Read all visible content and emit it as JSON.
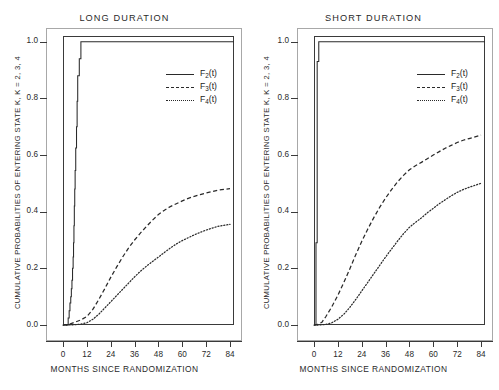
{
  "figure": {
    "xlabel": "MONTHS SINCE RANDOMIZATION",
    "ylabel": "CUMULATIVE PROBABILITIES OF ENTERING STATE K, K = 2, 3, 4",
    "xticks": [
      "0",
      "12",
      "24",
      "36",
      "48",
      "60",
      "72",
      "84"
    ],
    "yticks": [
      "0.0",
      "0.2",
      "0.4",
      "0.6",
      "0.8",
      "1.0"
    ],
    "legend": [
      {
        "key": "solid",
        "base": "F",
        "sub": "2",
        "suffix": "(t)",
        "label": "F2(t)"
      },
      {
        "key": "dashed",
        "base": "F",
        "sub": "3",
        "suffix": "(t)",
        "label": "F3(t)"
      },
      {
        "key": "dotted",
        "base": "F",
        "sub": "4",
        "suffix": "(t)",
        "label": "F4(t)"
      }
    ],
    "panels": [
      {
        "id": "long",
        "title": "LONG DURATION"
      },
      {
        "id": "short",
        "title": "SHORT DURATION"
      }
    ],
    "colors": {
      "line": "#2a2a2a",
      "frame": "#3a3a3a",
      "outer_frame": "#a8a8a8",
      "background": "#ffffff"
    }
  },
  "chart_data": [
    {
      "type": "line",
      "title": "LONG DURATION",
      "xlabel": "MONTHS SINCE RANDOMIZATION",
      "ylabel": "CUMULATIVE PROBABILITIES OF ENTERING STATE K, K = 2, 3, 4",
      "xlim": [
        0,
        86
      ],
      "ylim": [
        0.0,
        1.02
      ],
      "xticks": [
        0,
        12,
        24,
        36,
        48,
        60,
        72,
        84
      ],
      "yticks": [
        0.0,
        0.2,
        0.4,
        0.6,
        0.8,
        1.0
      ],
      "grid": false,
      "legend_position": "upper-right",
      "series": [
        {
          "name": "F2(t)",
          "style": "solid",
          "step": true,
          "points": [
            [
              0.0,
              0.0
            ],
            [
              2.6,
              0.0
            ],
            [
              2.6,
              0.025
            ],
            [
              3.1,
              0.025
            ],
            [
              3.1,
              0.05
            ],
            [
              3.5,
              0.05
            ],
            [
              3.5,
              0.078
            ],
            [
              3.9,
              0.078
            ],
            [
              3.9,
              0.1
            ],
            [
              4.2,
              0.1
            ],
            [
              4.2,
              0.128
            ],
            [
              4.5,
              0.128
            ],
            [
              4.5,
              0.158
            ],
            [
              4.8,
              0.158
            ],
            [
              4.8,
              0.2
            ],
            [
              5.1,
              0.2
            ],
            [
              5.1,
              0.24
            ],
            [
              5.3,
              0.24
            ],
            [
              5.3,
              0.29
            ],
            [
              5.5,
              0.29
            ],
            [
              5.5,
              0.35
            ],
            [
              5.7,
              0.35
            ],
            [
              5.7,
              0.42
            ],
            [
              5.9,
              0.42
            ],
            [
              5.9,
              0.48
            ],
            [
              6.1,
              0.48
            ],
            [
              6.1,
              0.545
            ],
            [
              6.4,
              0.545
            ],
            [
              6.4,
              0.625
            ],
            [
              6.8,
              0.625
            ],
            [
              6.8,
              0.7
            ],
            [
              7.1,
              0.7
            ],
            [
              7.1,
              0.79
            ],
            [
              7.4,
              0.79
            ],
            [
              7.4,
              0.88
            ],
            [
              8.2,
              0.88
            ],
            [
              8.2,
              0.94
            ],
            [
              9.0,
              0.94
            ],
            [
              9.0,
              1.0
            ],
            [
              86.0,
              1.0
            ]
          ]
        },
        {
          "name": "F3(t)",
          "style": "dashed",
          "step": false,
          "points": [
            [
              0,
              0.0
            ],
            [
              3,
              0.002
            ],
            [
              6,
              0.01
            ],
            [
              9,
              0.018
            ],
            [
              12,
              0.03
            ],
            [
              15,
              0.055
            ],
            [
              18,
              0.09
            ],
            [
              21,
              0.128
            ],
            [
              24,
              0.168
            ],
            [
              27,
              0.205
            ],
            [
              30,
              0.24
            ],
            [
              33,
              0.272
            ],
            [
              36,
              0.3
            ],
            [
              39,
              0.325
            ],
            [
              42,
              0.348
            ],
            [
              45,
              0.37
            ],
            [
              48,
              0.39
            ],
            [
              51,
              0.405
            ],
            [
              54,
              0.418
            ],
            [
              57,
              0.428
            ],
            [
              60,
              0.438
            ],
            [
              63,
              0.447
            ],
            [
              66,
              0.454
            ],
            [
              69,
              0.46
            ],
            [
              72,
              0.466
            ],
            [
              75,
              0.471
            ],
            [
              78,
              0.476
            ],
            [
              81,
              0.479
            ],
            [
              84,
              0.481
            ]
          ],
          "final_value": 0.48
        },
        {
          "name": "F4(t)",
          "style": "dotted",
          "step": false,
          "points": [
            [
              0,
              0.0
            ],
            [
              3,
              0.0
            ],
            [
              6,
              0.001
            ],
            [
              9,
              0.003
            ],
            [
              12,
              0.008
            ],
            [
              15,
              0.02
            ],
            [
              18,
              0.038
            ],
            [
              21,
              0.06
            ],
            [
              24,
              0.082
            ],
            [
              27,
              0.104
            ],
            [
              30,
              0.126
            ],
            [
              33,
              0.148
            ],
            [
              36,
              0.17
            ],
            [
              39,
              0.19
            ],
            [
              42,
              0.208
            ],
            [
              45,
              0.224
            ],
            [
              48,
              0.24
            ],
            [
              51,
              0.256
            ],
            [
              54,
              0.272
            ],
            [
              57,
              0.286
            ],
            [
              60,
              0.298
            ],
            [
              63,
              0.308
            ],
            [
              66,
              0.318
            ],
            [
              69,
              0.327
            ],
            [
              72,
              0.335
            ],
            [
              75,
              0.342
            ],
            [
              78,
              0.348
            ],
            [
              81,
              0.352
            ],
            [
              84,
              0.355
            ]
          ],
          "final_value": 0.355
        }
      ]
    },
    {
      "type": "line",
      "title": "SHORT DURATION",
      "xlabel": "MONTHS SINCE RANDOMIZATION",
      "ylabel": "CUMULATIVE PROBABILITIES OF ENTERING STATE K, K = 2, 3, 4",
      "xlim": [
        0,
        86
      ],
      "ylim": [
        0.0,
        1.02
      ],
      "xticks": [
        0,
        12,
        24,
        36,
        48,
        60,
        72,
        84
      ],
      "yticks": [
        0.0,
        0.2,
        0.4,
        0.6,
        0.8,
        1.0
      ],
      "grid": false,
      "legend_position": "upper-right",
      "series": [
        {
          "name": "F2(t)",
          "style": "solid",
          "step": true,
          "points": [
            [
              0.0,
              0.0
            ],
            [
              1.0,
              0.0
            ],
            [
              1.0,
              0.29
            ],
            [
              1.6,
              0.29
            ],
            [
              1.6,
              0.93
            ],
            [
              2.4,
              0.93
            ],
            [
              2.4,
              1.0
            ],
            [
              86.0,
              1.0
            ]
          ]
        },
        {
          "name": "F3(t)",
          "style": "dashed",
          "step": false,
          "points": [
            [
              0,
              0.0
            ],
            [
              2,
              0.002
            ],
            [
              4,
              0.01
            ],
            [
              6,
              0.03
            ],
            [
              9,
              0.065
            ],
            [
              12,
              0.105
            ],
            [
              15,
              0.15
            ],
            [
              18,
              0.198
            ],
            [
              21,
              0.248
            ],
            [
              24,
              0.295
            ],
            [
              27,
              0.338
            ],
            [
              30,
              0.378
            ],
            [
              33,
              0.415
            ],
            [
              36,
              0.448
            ],
            [
              39,
              0.478
            ],
            [
              42,
              0.505
            ],
            [
              45,
              0.528
            ],
            [
              48,
              0.548
            ],
            [
              51,
              0.562
            ],
            [
              54,
              0.574
            ],
            [
              57,
              0.587
            ],
            [
              60,
              0.6
            ],
            [
              63,
              0.612
            ],
            [
              66,
              0.624
            ],
            [
              69,
              0.634
            ],
            [
              72,
              0.644
            ],
            [
              75,
              0.652
            ],
            [
              78,
              0.658
            ],
            [
              81,
              0.664
            ],
            [
              84,
              0.67
            ]
          ],
          "final_value": 0.67
        },
        {
          "name": "F4(t)",
          "style": "dotted",
          "step": false,
          "points": [
            [
              0,
              0.0
            ],
            [
              3,
              0.0
            ],
            [
              6,
              0.002
            ],
            [
              9,
              0.008
            ],
            [
              12,
              0.02
            ],
            [
              15,
              0.038
            ],
            [
              18,
              0.062
            ],
            [
              21,
              0.09
            ],
            [
              24,
              0.12
            ],
            [
              27,
              0.15
            ],
            [
              30,
              0.18
            ],
            [
              33,
              0.21
            ],
            [
              36,
              0.24
            ],
            [
              39,
              0.268
            ],
            [
              42,
              0.296
            ],
            [
              45,
              0.322
            ],
            [
              48,
              0.345
            ],
            [
              51,
              0.362
            ],
            [
              54,
              0.378
            ],
            [
              57,
              0.396
            ],
            [
              60,
              0.412
            ],
            [
              63,
              0.428
            ],
            [
              66,
              0.442
            ],
            [
              69,
              0.456
            ],
            [
              72,
              0.468
            ],
            [
              75,
              0.478
            ],
            [
              78,
              0.486
            ],
            [
              81,
              0.493
            ],
            [
              84,
              0.5
            ]
          ],
          "final_value": 0.5
        }
      ]
    }
  ]
}
